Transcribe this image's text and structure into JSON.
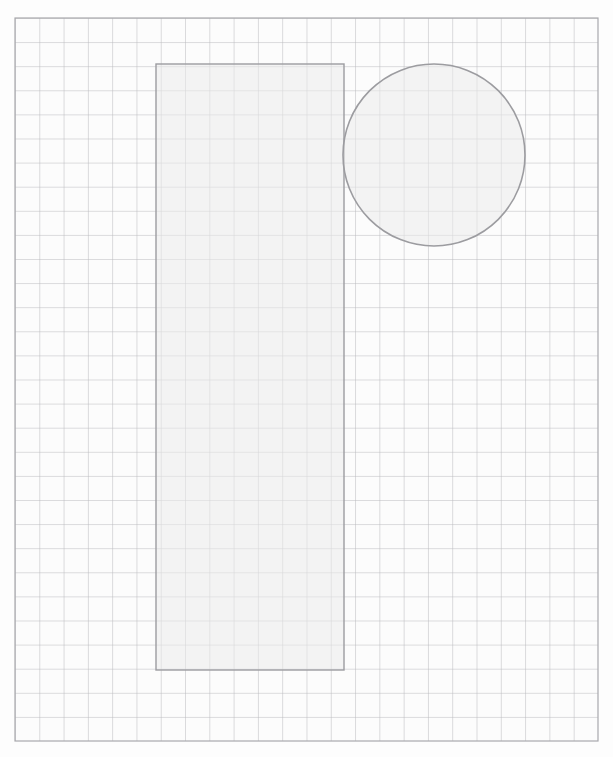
{
  "canvas": {
    "width": 613,
    "height": 757,
    "background_color": "#fdfdfd",
    "label": "grid-worksheet"
  },
  "grid": {
    "name": "square-grid",
    "x": 15,
    "y": 18,
    "width": 583,
    "height": 723,
    "columns": 24,
    "rows": 30,
    "cell_width": 24.29,
    "cell_height": 24.1,
    "line_color": "#b9b9bd",
    "line_width": 1,
    "border_color": "#a9a9ad",
    "border_width": 1.2,
    "cell_fill": "#fcfcfc"
  },
  "chart_data": {
    "type": "scatter",
    "title": "",
    "subtitle": "",
    "xlabel": "",
    "ylabel": "",
    "grid": true,
    "legend": "none",
    "units": "grid cells",
    "axis_origin": "top-left",
    "xlim": [
      0,
      24
    ],
    "ylim": [
      0,
      30
    ],
    "shapes": [
      {
        "id": "shape-rectangle",
        "kind": "rectangle",
        "label": "Rectangle",
        "x": 156,
        "y": 64,
        "width": 188,
        "height": 606,
        "grid_x": 5.8,
        "grid_y": 1.9,
        "grid_width": 7.74,
        "grid_height": 25.15,
        "area_cells": 194.7,
        "fill": "#ebebeb",
        "fill_opacity": 0.55,
        "stroke": "#9c9ca0",
        "stroke_width": 1.4
      },
      {
        "id": "shape-circle",
        "kind": "circle",
        "label": "Circle",
        "cx": 434,
        "cy": 155,
        "r": 91,
        "grid_cx": 17.25,
        "grid_cy": 5.69,
        "grid_r": 3.75,
        "area_cells": 44.2,
        "fill": "#ebebeb",
        "fill_opacity": 0.55,
        "stroke": "#9c9ca0",
        "stroke_width": 1.6
      }
    ]
  },
  "colors": {
    "shape_fill": "#ebebeb",
    "shape_stroke": "#9c9ca0",
    "grid_line": "#b9b9bd",
    "page_background": "#fdfdfd"
  }
}
